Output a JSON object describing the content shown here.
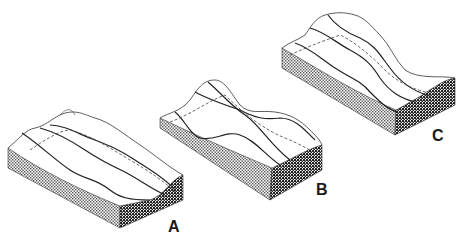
{
  "figure": {
    "type": "block-diagram-series",
    "blocks": [
      {
        "id": "A",
        "label": "A"
      },
      {
        "id": "B",
        "label": "B"
      },
      {
        "id": "C",
        "label": "C"
      }
    ]
  },
  "colors": {
    "line": "#222222",
    "hatch_light": "#888888",
    "hatch_dark": "#2a2a2a",
    "background": "#ffffff"
  }
}
